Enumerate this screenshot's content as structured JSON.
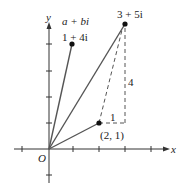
{
  "diagram": {
    "axes": {
      "x_label": "x",
      "y_label": "y",
      "origin_label": "O"
    },
    "general_form_label": "a + bi",
    "points": [
      {
        "label": "1 + 4i",
        "x": 1,
        "y": 4
      },
      {
        "label": "3 + 5i",
        "x": 3,
        "y": 5
      },
      {
        "label": "(2, 1)",
        "x": 2,
        "y": 1
      }
    ],
    "dashed_labels": {
      "horizontal": "1",
      "vertical": "4"
    }
  }
}
